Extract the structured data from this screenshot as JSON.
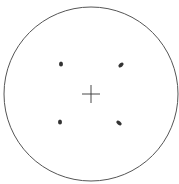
{
  "diagram": {
    "type": "diffraction-pattern",
    "boundary_circle": {
      "cx": 91,
      "cy": 94,
      "r": 87,
      "stroke": "#555555"
    },
    "center_cross": {
      "cx": 91,
      "cy": 94,
      "arm": 9,
      "stroke": "#333333"
    },
    "spots": [
      {
        "x": 61,
        "y": 64,
        "rx": 2,
        "ry": 2.5,
        "angle": 0
      },
      {
        "x": 121,
        "y": 65,
        "rx": 1.8,
        "ry": 3,
        "angle": 50
      },
      {
        "x": 60,
        "y": 122,
        "rx": 2,
        "ry": 2.5,
        "angle": 0
      },
      {
        "x": 119,
        "y": 123,
        "rx": 1.8,
        "ry": 3,
        "angle": -55
      }
    ],
    "spot_color": "#333333"
  }
}
